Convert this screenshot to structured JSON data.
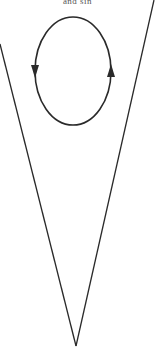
{
  "caption": "and sin",
  "colors": {
    "stroke": "#2a2a2a",
    "background": "#ffffff"
  },
  "diagram": {
    "cone": {
      "left_edge": {
        "x1": 0,
        "y1": 44,
        "x2": 76,
        "y2": 346
      },
      "right_edge": {
        "x1": 154,
        "y1": 0,
        "x2": 76,
        "y2": 346
      },
      "vertex": {
        "x": 76,
        "y": 346
      }
    },
    "loop": {
      "shape": "ellipse",
      "cx": 73,
      "cy": 71,
      "rx": 38,
      "ry": 54,
      "direction": "counterclockwise",
      "arrows": [
        {
          "position": "left",
          "x": 35,
          "y": 71,
          "points": "down"
        },
        {
          "position": "right",
          "x": 111,
          "y": 71,
          "points": "up"
        }
      ]
    }
  }
}
